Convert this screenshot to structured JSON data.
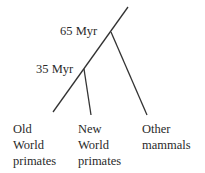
{
  "diagram": {
    "type": "phylogenetic-tree",
    "line_color": "#333333",
    "nodes": [
      {
        "label": "65 Myr"
      },
      {
        "label": "35 Myr"
      }
    ],
    "leaves": [
      {
        "lines": [
          "Old",
          "World",
          "primates"
        ]
      },
      {
        "lines": [
          "New",
          "World",
          "primates"
        ]
      },
      {
        "lines": [
          "Other",
          "mammals"
        ]
      }
    ]
  }
}
